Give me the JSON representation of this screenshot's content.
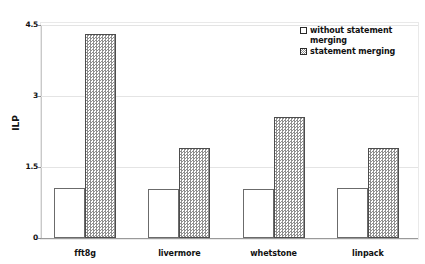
{
  "chart_data": {
    "type": "bar",
    "title": "",
    "xlabel": "",
    "ylabel": "ILP",
    "ylim": [
      0,
      4.5
    ],
    "yticks": [
      "0",
      "1.5",
      "3",
      "4.5"
    ],
    "ytick_values": [
      0,
      1.5,
      3,
      4.5
    ],
    "grid": true,
    "legend_position": "top-right",
    "categories": [
      "fft8g",
      "livermore",
      "whetstone",
      "linpack"
    ],
    "series": [
      {
        "name": "without statement merging",
        "pattern": "solid-white",
        "values": [
          1.05,
          1.03,
          1.03,
          1.05
        ]
      },
      {
        "name": "statement merging",
        "pattern": "hatched-gray",
        "values": [
          4.3,
          1.9,
          2.55,
          1.9
        ]
      }
    ]
  },
  "legend": {
    "items": [
      {
        "label": "without statement merging",
        "swatch": "plain-square-icon"
      },
      {
        "label": "statement merging",
        "swatch": "hatched-square-icon"
      }
    ]
  },
  "colors": {
    "bar_plain_fill": "#ffffff",
    "bar_plain_border": "#6b6b6b",
    "bar_hatch_fill": "#8f8f8f",
    "bar_hatch_border": "#4d4d4d",
    "gridline": "#e4e4e4",
    "axis": "#9a9a9a",
    "text": "#111111",
    "background": "#ffffff"
  }
}
